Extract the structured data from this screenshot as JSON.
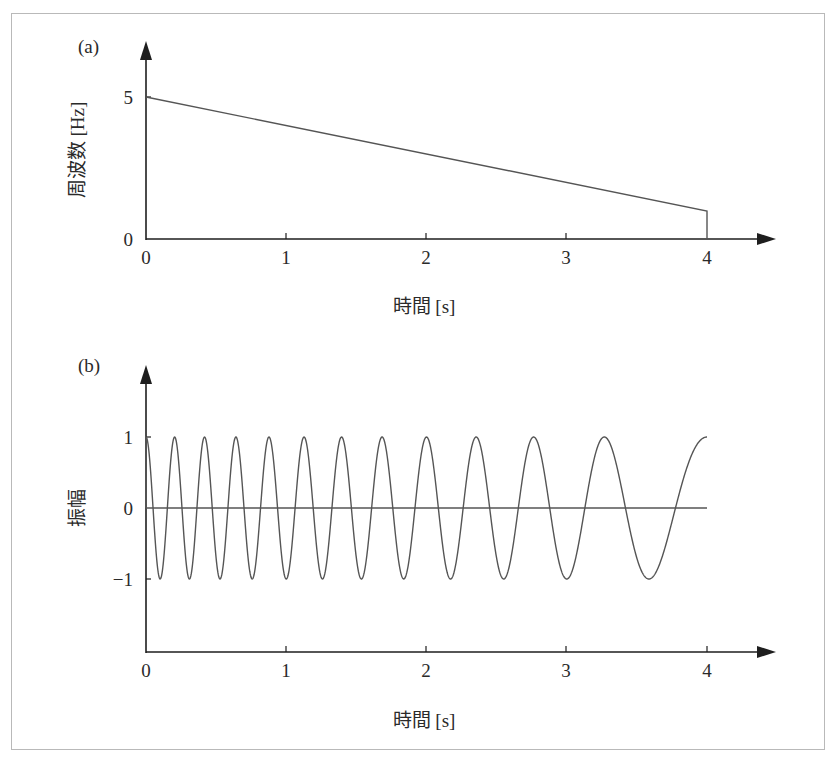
{
  "panels": [
    {
      "id": "a",
      "panel_label": "(a)",
      "ylabel": "周波数 [Hz]",
      "xlabel": "時間 [s]",
      "yticks": [
        "0",
        "5"
      ],
      "xticks": [
        "0",
        "1",
        "2",
        "3",
        "4"
      ]
    },
    {
      "id": "b",
      "panel_label": "(b)",
      "ylabel": "振幅",
      "xlabel": "時間 [s]",
      "yticks": [
        "1",
        "0",
        "−1"
      ],
      "xticks": [
        "0",
        "1",
        "2",
        "3",
        "4"
      ]
    }
  ],
  "colors": {
    "axis": "#1e1e1e",
    "curve": "#555555",
    "frame": "#b9b9b9"
  },
  "chart_data": [
    {
      "type": "line",
      "title": "(a)",
      "xlabel": "時間 [s]",
      "ylabel": "周波数 [Hz]",
      "x": [
        0,
        4,
        4
      ],
      "y": [
        5,
        1,
        0
      ],
      "series": [
        {
          "name": "instantaneous frequency",
          "x": [
            0,
            1,
            2,
            3,
            4
          ],
          "values": [
            5,
            4,
            3,
            2,
            1
          ]
        }
      ],
      "xlim": [
        0,
        4.4
      ],
      "ylim": [
        0,
        6.4
      ],
      "xticks": [
        0,
        1,
        2,
        3,
        4
      ],
      "yticks": [
        0,
        5
      ],
      "grid": false,
      "legend": null
    },
    {
      "type": "line",
      "title": "(b)",
      "xlabel": "時間 [s]",
      "ylabel": "振幅",
      "series": [
        {
          "name": "chirp signal cos(2π(5t − t²/2))",
          "f0_hz": 5,
          "f1_hz": 1,
          "duration_s": 4,
          "amplitude": 1
        }
      ],
      "xlim": [
        0,
        4.4
      ],
      "ylim": [
        -2,
        2.1
      ],
      "xticks": [
        0,
        1,
        2,
        3,
        4
      ],
      "yticks": [
        -1,
        0,
        1
      ],
      "grid": false,
      "legend": null
    }
  ]
}
